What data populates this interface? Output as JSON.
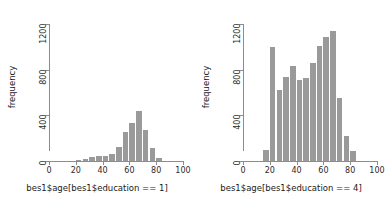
{
  "figure": {
    "background": "#ffffff",
    "bar_color": "#9a9a9a",
    "axis_color": "#8c8c8c",
    "text_color": "#1a1a1a"
  },
  "chart_data": [
    {
      "type": "bar",
      "panel": "left",
      "title": "",
      "xlabel": "bes1$age[bes1$education == 1]",
      "ylabel": "frequency",
      "xlim": [
        0,
        100
      ],
      "ylim": [
        0,
        1200
      ],
      "xticks": [
        0,
        20,
        40,
        60,
        80,
        100
      ],
      "yticks": [
        0,
        400,
        800,
        1200
      ],
      "grid": false,
      "legend": "none",
      "bin_width": 5,
      "bin_starts": [
        20,
        25,
        30,
        35,
        40,
        45,
        50,
        55,
        60,
        65,
        70,
        75,
        80
      ],
      "values": [
        10,
        20,
        35,
        40,
        45,
        60,
        120,
        250,
        330,
        440,
        275,
        110,
        30
      ]
    },
    {
      "type": "bar",
      "panel": "right",
      "title": "",
      "xlabel": "bes1$age[bes1$education == 4]",
      "ylabel": "frequency",
      "xlim": [
        0,
        100
      ],
      "ylim": [
        0,
        1200
      ],
      "xticks": [
        0,
        20,
        40,
        60,
        80,
        100
      ],
      "yticks": [
        0,
        400,
        800,
        1200
      ],
      "grid": false,
      "legend": "none",
      "bin_width": 5,
      "bin_starts": [
        15,
        20,
        25,
        30,
        35,
        40,
        45,
        50,
        55,
        60,
        65,
        70,
        75,
        80
      ],
      "values": [
        100,
        1000,
        620,
        740,
        830,
        710,
        730,
        860,
        1010,
        1090,
        1140,
        550,
        220,
        85
      ]
    }
  ]
}
